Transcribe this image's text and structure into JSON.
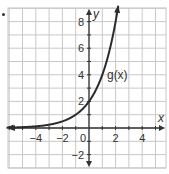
{
  "chart_data": {
    "type": "line",
    "title": "",
    "xlabel": "x",
    "ylabel": "y",
    "xlim": [
      -6.3,
      5.8
    ],
    "ylim": [
      -3,
      9
    ],
    "grid": true,
    "x_ticks": [
      -4,
      -2,
      0,
      2,
      4
    ],
    "y_ticks": [
      -2,
      2,
      4,
      6,
      8
    ],
    "x_tick_labels": [
      "−4",
      "−2",
      "0",
      "2",
      "4"
    ],
    "y_tick_labels": [
      "−2",
      "2",
      "4",
      "6",
      "8"
    ],
    "series": [
      {
        "name": "g(x)",
        "label": "g(x)",
        "function": "2 * 2^x",
        "x": [
          -6,
          -5,
          -4,
          -3,
          -2,
          -1,
          0,
          1,
          2,
          2.2
        ],
        "y": [
          0.03,
          0.06,
          0.125,
          0.25,
          0.5,
          1,
          2,
          4,
          8,
          9.2
        ],
        "color": "#2b2b2b",
        "arrows": "both"
      }
    ],
    "annotations": [
      {
        "text": "g(x)",
        "x": 1.4,
        "y": 4
      }
    ],
    "legend": "none"
  },
  "labels": {
    "x_axis": "x",
    "y_axis": "y",
    "curve": "g(x)",
    "origin": "0"
  },
  "colors": {
    "grid": "#c8c8c8",
    "axis": "#333333",
    "curve": "#2b2b2b",
    "text": "#333333",
    "background": "#ffffff"
  }
}
